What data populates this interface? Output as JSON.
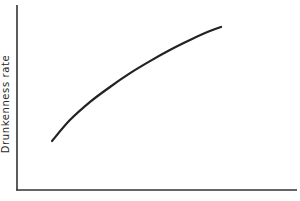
{
  "chart_data": {
    "type": "line",
    "title": "",
    "xlabel": "",
    "ylabel": "Drunkenness rate",
    "x_ticks": [],
    "y_ticks": [],
    "grid": false,
    "legend": null,
    "note": "Conceptual curve with no numeric scale; values are normalized (0-1) positions within the plot area. The x-axis label is cropped at the bottom of the image.",
    "xlim": [
      0,
      1
    ],
    "ylim": [
      0,
      1
    ],
    "series": [
      {
        "name": "Drunkenness rate",
        "x": [
          0.125,
          0.189,
          0.261,
          0.332,
          0.404,
          0.475,
          0.546,
          0.618,
          0.689,
          0.729
        ],
        "y": [
          0.265,
          0.378,
          0.476,
          0.557,
          0.632,
          0.697,
          0.757,
          0.811,
          0.859,
          0.881
        ]
      }
    ],
    "colors": {
      "line": "#222222",
      "axes": "#333333",
      "background": "#ffffff"
    }
  }
}
